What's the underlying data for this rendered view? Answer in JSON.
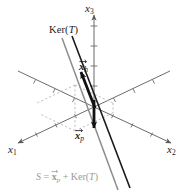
{
  "figure": {
    "background_color": "#ffffff",
    "axes": [
      {
        "id": "x1",
        "label_main": "x",
        "label_sub": "1",
        "direction": "lower-left"
      },
      {
        "id": "x2",
        "label_main": "x",
        "label_sub": "2",
        "direction": "lower-right"
      },
      {
        "id": "x3",
        "label_main": "x",
        "label_sub": "3",
        "direction": "up"
      }
    ],
    "annotations": {
      "kernel_label": {
        "text_main": "Ker(",
        "text_italic": "T",
        "text_end": ")"
      },
      "vector_h": {
        "symbol": "x",
        "sub": "h"
      },
      "vector_p": {
        "symbol": "x",
        "sub": "p"
      },
      "caption": {
        "lead": "S",
        "equals": " = ",
        "vec_symbol": "x",
        "vec_sub": "p",
        "plus": " + Ker(",
        "italic": "T",
        "close": ")"
      }
    },
    "colors": {
      "axis": "#5a5a5a",
      "kernel_line": "#1a1a1a",
      "solution_line": "#8c8c8c",
      "vector": "#111111",
      "dashed_guide": "#a9a9a9",
      "caption_text": "#9a9a9a",
      "label_text": "#1a1a1a"
    }
  }
}
